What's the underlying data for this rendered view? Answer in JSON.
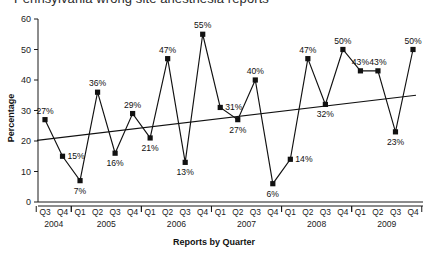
{
  "chart_data": {
    "type": "line",
    "title": "Pennsylvania wrong site anesthesia reports",
    "xlabel": "Reports by Quarter",
    "ylabel": "Percentage",
    "ylim": [
      0,
      60
    ],
    "yticks": [
      0,
      10,
      20,
      30,
      40,
      50,
      60
    ],
    "ytick_labels": [
      "0",
      "10",
      "20",
      "30",
      "40",
      "50",
      "60"
    ],
    "grid": false,
    "legend": "none",
    "categories": [
      "Q3",
      "Q4",
      "Q1",
      "Q2",
      "Q3",
      "Q4",
      "Q1",
      "Q2",
      "Q3",
      "Q4",
      "Q1",
      "Q2",
      "Q3",
      "Q4",
      "Q1",
      "Q2",
      "Q3",
      "Q4",
      "Q1",
      "Q2",
      "Q3",
      "Q4"
    ],
    "year_groups": [
      {
        "year": "2004",
        "start": 0,
        "count": 2
      },
      {
        "year": "2005",
        "start": 2,
        "count": 4
      },
      {
        "year": "2006",
        "start": 6,
        "count": 4
      },
      {
        "year": "2007",
        "start": 10,
        "count": 4
      },
      {
        "year": "2008",
        "start": 14,
        "count": 4
      },
      {
        "year": "2009",
        "start": 18,
        "count": 4
      }
    ],
    "values": [
      27,
      15,
      7,
      36,
      16,
      29,
      21,
      47,
      13,
      55,
      31,
      27,
      40,
      6,
      14,
      47,
      32,
      50,
      43,
      43,
      23,
      50
    ],
    "point_labels": [
      "27%",
      "15%",
      "7%",
      "36%",
      "16%",
      "29%",
      "21%",
      "47%",
      "13%",
      "55%",
      "31%",
      "27%",
      "40%",
      "6%",
      "14%",
      "47%",
      "32%",
      "50%",
      "43%",
      "43%",
      "23%",
      "50%"
    ],
    "label_positions": [
      "above",
      "right",
      "below",
      "above",
      "below",
      "above",
      "below",
      "above",
      "below",
      "above",
      "right",
      "below",
      "above",
      "below",
      "right",
      "above",
      "below",
      "above",
      "above",
      "above",
      "below",
      "above"
    ],
    "trendline": {
      "name": "linear trend",
      "start_value": 20.2,
      "end_value": 35.0
    },
    "marker": "square",
    "color": "#111111"
  }
}
